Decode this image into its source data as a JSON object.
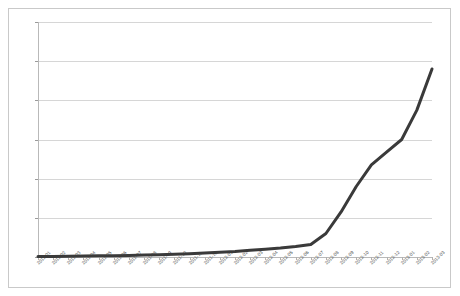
{
  "chart_data": {
    "type": "line",
    "title": "",
    "subtitle": "",
    "xlabel": "",
    "ylabel": "",
    "legend": [],
    "legend_position": "none",
    "grid": true,
    "xlim_categories": 27,
    "ylim": [
      0,
      600000
    ],
    "ytick_labels": [
      "600000",
      "500000",
      "400000",
      "300000",
      "200000",
      "100000",
      "0"
    ],
    "ytick_values": [
      600000,
      500000,
      400000,
      300000,
      200000,
      100000,
      0
    ],
    "ytick_step": 100000,
    "categories": [
      "2011-01",
      "2011-02",
      "2011-03",
      "2011-04",
      "2011-05",
      "2011-06",
      "2011-07",
      "2011-08",
      "2011-09",
      "2011-10",
      "2011-11",
      "2011-12",
      "2012-01",
      "2012-02",
      "2012-03",
      "2012-04",
      "2012-05",
      "2012-06",
      "2012-07",
      "2012-08",
      "2012-09",
      "2012-10",
      "2012-11",
      "2012-12",
      "2013-01",
      "2013-02",
      "2013-03"
    ],
    "values": [
      1000,
      1500,
      2000,
      2500,
      3000,
      3500,
      4000,
      5000,
      6000,
      7000,
      8500,
      10000,
      12000,
      14000,
      17000,
      20000,
      23000,
      27000,
      32000,
      60000,
      115000,
      180000,
      235000,
      268000,
      300000,
      375000,
      480000
    ],
    "series_color": "#3a3a3a",
    "series_width": 3,
    "grid_color": "#d6d6d6",
    "axis_color": "#b9b9b9",
    "frame_color": "#c9c9c9",
    "background": "#ffffff"
  }
}
